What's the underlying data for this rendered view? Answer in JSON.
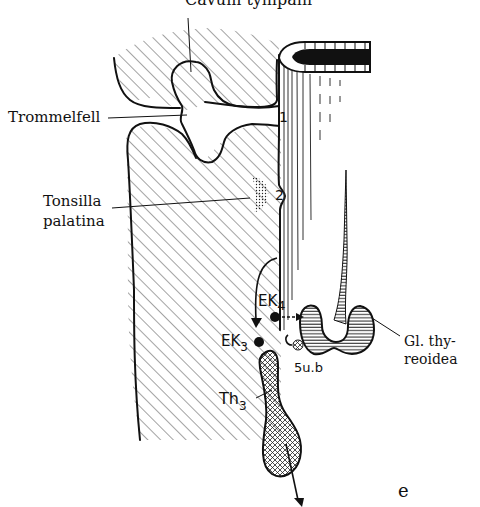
{
  "figure": {
    "panel_label": "e",
    "labels": {
      "cavum_tympani": "Cavum tympani",
      "trommelfell": "Trommelfell",
      "tonsilla_line1": "Tonsilla",
      "tonsilla_line2": "palatina",
      "gl_thyreoidea_line1": "Gl. thy-",
      "gl_thyreoidea_line2": "reoidea",
      "pouch_1": "1",
      "pouch_2": "2",
      "ek4": "EK",
      "ek4_sub": "4",
      "ek3": "EK",
      "ek3_sub": "3",
      "th3": "Th",
      "th3_sub": "3",
      "ub5": "5u.b"
    },
    "colors": {
      "ink": "#111111",
      "background": "#ffffff"
    }
  }
}
